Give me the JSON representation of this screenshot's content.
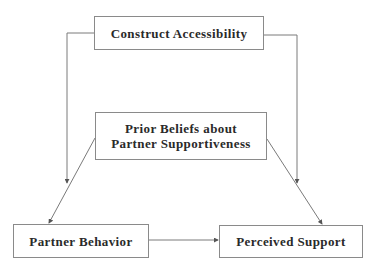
{
  "diagram": {
    "nodes": [
      {
        "id": "construct",
        "label": "Construct Accessibility"
      },
      {
        "id": "prior",
        "label_lines": [
          "Prior Beliefs about",
          "Partner Supportiveness"
        ]
      },
      {
        "id": "behavior",
        "label": "Partner Behavior"
      },
      {
        "id": "perceived",
        "label": "Perceived Support"
      }
    ],
    "edges": [
      {
        "from": "construct",
        "to": "behavior",
        "style": "elbow-left"
      },
      {
        "from": "construct",
        "to": "perceived",
        "style": "elbow-right"
      },
      {
        "from": "prior",
        "to": "behavior",
        "style": "straight"
      },
      {
        "from": "prior",
        "to": "perceived",
        "style": "straight"
      },
      {
        "from": "behavior",
        "to": "perceived",
        "style": "straight"
      }
    ],
    "colors": {
      "line": "#7a7a7a",
      "border": "#8a8a8a",
      "text": "#2a2a2a"
    }
  }
}
